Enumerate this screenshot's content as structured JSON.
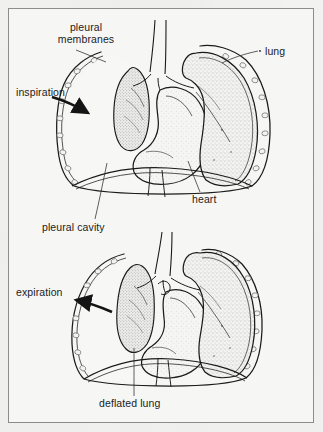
{
  "figure": {
    "background_color": "#f2f2f1",
    "panel_color": "#f6f6f5",
    "frame_color": "#8c8c8c",
    "ink_color": "#1b1b1b",
    "stipple_color": "#9a9a9a"
  },
  "labels": {
    "pleural_membranes": "pleural\nmembranes",
    "pleural_membranes_line1": "pleural",
    "pleural_membranes_line2": "membranes",
    "lung": "lung",
    "inspiration": "inspiration",
    "heart": "heart",
    "pleural_cavity": "pleural cavity",
    "expiration": "expiration",
    "deflated_lung": "deflated lung"
  },
  "panels": [
    {
      "name": "upper-panel",
      "phase": "inspiration",
      "description": "Transverse section of thorax during inspiration showing a collapsed left lung, an inflated right lung, the heart and pleural cavity.",
      "callouts": [
        "pleural membranes",
        "lung",
        "inspiration",
        "heart",
        "pleural cavity"
      ]
    },
    {
      "name": "lower-panel",
      "phase": "expiration",
      "description": "Transverse section of thorax during expiration showing the deflated lung and the inflated right lung.",
      "callouts": [
        "expiration",
        "deflated lung"
      ]
    }
  ],
  "arrows": [
    {
      "name": "inspiration-arrow",
      "direction": "right",
      "panel": "upper-panel"
    },
    {
      "name": "expiration-arrow",
      "direction": "left",
      "panel": "lower-panel"
    }
  ],
  "structures": [
    "chest wall",
    "ribs",
    "pleural membranes",
    "pleural cavity",
    "collapsed lung",
    "inflated lung",
    "heart",
    "trachea",
    "bronchi",
    "diaphragm"
  ]
}
